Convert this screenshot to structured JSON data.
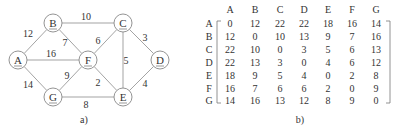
{
  "graph": {
    "caption": "a)",
    "nodes": [
      {
        "id": "A",
        "x": 18,
        "y": 60
      },
      {
        "id": "B",
        "x": 53,
        "y": 23
      },
      {
        "id": "C",
        "x": 123,
        "y": 23
      },
      {
        "id": "D",
        "x": 160,
        "y": 60
      },
      {
        "id": "E",
        "x": 123,
        "y": 97
      },
      {
        "id": "F",
        "x": 88,
        "y": 60
      },
      {
        "id": "G",
        "x": 53,
        "y": 97
      }
    ],
    "edges": [
      {
        "from": "A",
        "to": "B",
        "weight": "12",
        "lx": 28,
        "ly": 37
      },
      {
        "from": "A",
        "to": "F",
        "weight": "16",
        "lx": 51,
        "ly": 57
      },
      {
        "from": "A",
        "to": "G",
        "weight": "14",
        "lx": 28,
        "ly": 88
      },
      {
        "from": "B",
        "to": "C",
        "weight": "10",
        "lx": 86,
        "ly": 20
      },
      {
        "from": "B",
        "to": "F",
        "weight": "7",
        "lx": 65,
        "ly": 46
      },
      {
        "from": "C",
        "to": "F",
        "weight": "6",
        "lx": 98,
        "ly": 44
      },
      {
        "from": "C",
        "to": "D",
        "weight": "3",
        "lx": 145,
        "ly": 41
      },
      {
        "from": "C",
        "to": "E",
        "weight": "5",
        "lx": 126,
        "ly": 64
      },
      {
        "from": "F",
        "to": "G",
        "weight": "9",
        "lx": 67,
        "ly": 79
      },
      {
        "from": "F",
        "to": "E",
        "weight": "2",
        "lx": 98,
        "ly": 86
      },
      {
        "from": "G",
        "to": "E",
        "weight": "8",
        "lx": 86,
        "ly": 108
      },
      {
        "from": "E",
        "to": "D",
        "weight": "4",
        "lx": 145,
        "ly": 87
      }
    ]
  },
  "matrix": {
    "caption": "b)",
    "col_headers": [
      "A",
      "B",
      "C",
      "D",
      "E",
      "F",
      "G"
    ],
    "row_headers": [
      "A",
      "B",
      "C",
      "D",
      "E",
      "F",
      "G"
    ],
    "rows": [
      [
        "0",
        "12",
        "22",
        "22",
        "18",
        "16",
        "14"
      ],
      [
        "12",
        "0",
        "10",
        "13",
        "9",
        "7",
        "16"
      ],
      [
        "22",
        "10",
        "0",
        "3",
        "5",
        "6",
        "13"
      ],
      [
        "22",
        "13",
        "3",
        "0",
        "4",
        "6",
        "12"
      ],
      [
        "18",
        "9",
        "5",
        "4",
        "0",
        "2",
        "8"
      ],
      [
        "16",
        "7",
        "6",
        "6",
        "2",
        "0",
        "9"
      ],
      [
        "14",
        "16",
        "13",
        "12",
        "8",
        "9",
        "0"
      ]
    ]
  }
}
